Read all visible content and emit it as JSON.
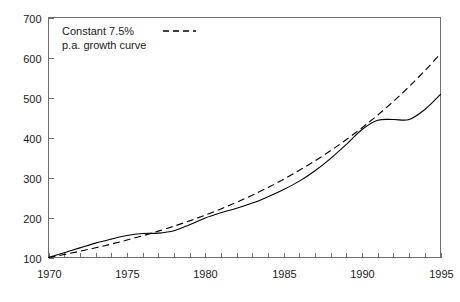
{
  "chart_data": {
    "type": "line",
    "title": "",
    "subtitle": "",
    "xlabel": "",
    "ylabel": "",
    "xlim": [
      1970,
      1995
    ],
    "ylim": [
      100,
      700
    ],
    "grid": false,
    "legend_position": "top-left",
    "y_ticks": [
      100,
      200,
      300,
      400,
      500,
      600,
      700
    ],
    "y_tick_labels": [
      "100",
      "200",
      "300",
      "400",
      "500",
      "600",
      "700"
    ],
    "x_ticks": [
      1970,
      1975,
      1980,
      1985,
      1990,
      1995
    ],
    "x_tick_labels": [
      "1970",
      "1975",
      "1980",
      "1985",
      "1990",
      "1995"
    ],
    "x_minor_ticks": [
      1970,
      1971,
      1972,
      1973,
      1974,
      1975,
      1976,
      1977,
      1978,
      1979,
      1980,
      1981,
      1982,
      1983,
      1984,
      1985,
      1986,
      1987,
      1988,
      1989,
      1990,
      1991,
      1992,
      1993,
      1994,
      1995
    ],
    "x": [
      1970,
      1971,
      1972,
      1973,
      1974,
      1975,
      1976,
      1977,
      1978,
      1979,
      1980,
      1981,
      1982,
      1983,
      1984,
      1985,
      1986,
      1987,
      1988,
      1989,
      1990,
      1991,
      1992,
      1993,
      1994,
      1995
    ],
    "series": [
      {
        "name": "index",
        "style": "solid",
        "color": "#000000",
        "values": [
          100,
          112,
          124,
          136,
          146,
          155,
          160,
          161,
          167,
          182,
          199,
          212,
          223,
          236,
          252,
          270,
          291,
          317,
          348,
          383,
          420,
          443,
          445,
          445,
          470,
          508
        ]
      },
      {
        "name": "Constant 7.5% p.a. growth curve",
        "style": "dashed",
        "color": "#000000",
        "values": [
          100,
          107.5,
          115.6,
          124.2,
          133.5,
          143.6,
          154.3,
          165.9,
          178.3,
          191.6,
          206.0,
          221.5,
          238.1,
          255.9,
          275.1,
          295.7,
          317.9,
          341.7,
          367.4,
          394.9,
          424.5,
          456.3,
          490.5,
          527.3,
          566.8,
          609.3
        ]
      }
    ],
    "annotations": []
  },
  "legend": {
    "line1": "Constant 7.5%",
    "line2": "p.a. growth curve",
    "sample_style": "dashed"
  },
  "colors": {
    "axis": "#6e6e6e",
    "line": "#000000",
    "text": "#1a1a1a",
    "background": "#ffffff"
  }
}
